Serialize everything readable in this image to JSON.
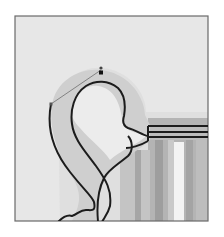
{
  "figure": {
    "colors": {
      "page_bg": "#ffffff",
      "frame_border": "#6a6a6a",
      "photo_bg": "#e6e6e6",
      "handle_fill": "#cfcfcf",
      "cup_body_dark": "#a8a8a8",
      "cup_highlight": "#f4f4f4",
      "rim_band": "#b9b9b9",
      "path_stroke": "#1c1c1c",
      "direction_line": "#6e6e6e"
    },
    "anchor_point": {
      "x": 101,
      "y": 72
    },
    "direction_handle_end": {
      "x": 51,
      "y": 104
    }
  }
}
